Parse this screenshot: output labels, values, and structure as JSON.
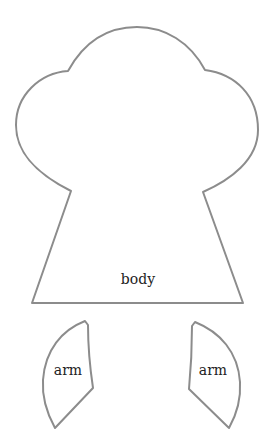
{
  "pattern": {
    "pieces": [
      {
        "name": "body",
        "label": "body"
      },
      {
        "name": "arm-left",
        "label": "arm"
      },
      {
        "name": "arm-right",
        "label": "arm"
      }
    ],
    "colors": {
      "outline": "#8c8c8c",
      "text": "#222222",
      "background": "#ffffff"
    }
  }
}
